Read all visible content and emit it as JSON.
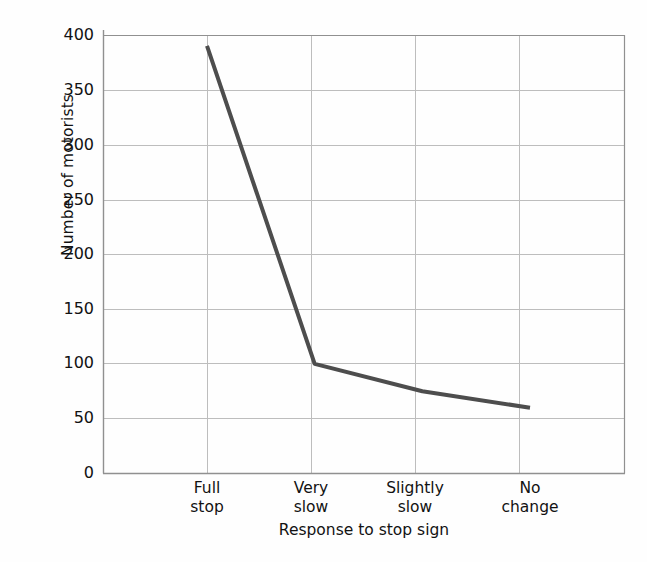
{
  "chart_data": {
    "type": "line",
    "title": "",
    "xlabel": "Response to stop sign",
    "ylabel": "Number of motorists",
    "categories": [
      "Full stop",
      "Very slow",
      "Slightly slow",
      "No change"
    ],
    "values": [
      390,
      100,
      75,
      60
    ],
    "ylim": [
      0,
      400
    ],
    "yticks": [
      0,
      50,
      100,
      150,
      200,
      250,
      300,
      350,
      400
    ],
    "ytick_labels": [
      "0",
      "50",
      "100",
      "150",
      "200",
      "250",
      "300",
      "350",
      "400"
    ],
    "grid": true,
    "legend": "none",
    "series": [
      {
        "name": "Number of motorists",
        "values": [
          390,
          100,
          75,
          60
        ],
        "color": "#4d4d4d",
        "line_width": 4,
        "markers": "none"
      }
    ],
    "points": [
      {
        "category": "Full stop",
        "label_line1": "Full",
        "label_line2": "stop",
        "value": 390
      },
      {
        "category": "Very slow",
        "label_line1": "Very",
        "label_line2": "slow",
        "value": 100
      },
      {
        "category": "Slightly slow",
        "label_line1": "Slightly",
        "label_line2": "slow",
        "value": 75
      },
      {
        "category": "No change",
        "label_line1": "No",
        "label_line2": "change",
        "value": 60
      }
    ]
  },
  "style": {
    "background": "#fefefe",
    "axis_color": "#8c8c8c",
    "grid_color": "#b4b4b4",
    "line_color": "#4d4d4d",
    "text_color": "#121212"
  },
  "axis": {
    "y_title": "Number of motorists",
    "x_title": "Response to stop sign"
  },
  "y_ticks": [
    {
      "label": "400",
      "value": 400
    },
    {
      "label": "350",
      "value": 350
    },
    {
      "label": "300",
      "value": 300
    },
    {
      "label": "250",
      "value": 250
    },
    {
      "label": "200",
      "value": 200
    },
    {
      "label": "150",
      "value": 150
    },
    {
      "label": "100",
      "value": 100
    },
    {
      "label": "50",
      "value": 50
    },
    {
      "label": "0",
      "value": 0
    }
  ],
  "x_ticks": [
    {
      "line1": "Full",
      "line2": "stop"
    },
    {
      "line1": "Very",
      "line2": "slow"
    },
    {
      "line1": "Slightly",
      "line2": "slow"
    },
    {
      "line1": "No",
      "line2": "change"
    }
  ]
}
